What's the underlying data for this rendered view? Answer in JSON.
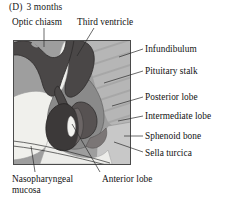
{
  "figure": {
    "panel_id": "(D)",
    "panel_title": "3 months",
    "type": "anatomical-diagram"
  },
  "labels": [
    {
      "key": "optic_chiasm",
      "text": "Optic chiasm",
      "position": "top-left"
    },
    {
      "key": "third_ventricle",
      "text": "Third ventricle",
      "position": "top-center"
    },
    {
      "key": "infundibulum",
      "text": "Infundibulum",
      "position": "right"
    },
    {
      "key": "pituitary_stalk",
      "text": "Pituitary stalk",
      "position": "right"
    },
    {
      "key": "posterior_lobe",
      "text": "Posterior lobe",
      "position": "right"
    },
    {
      "key": "intermediate_lobe",
      "text": "Intermediate lobe",
      "position": "right"
    },
    {
      "key": "sphenoid_bone",
      "text": "Sphenoid bone",
      "position": "right"
    },
    {
      "key": "sella_turcica",
      "text": "Sella turcica",
      "position": "right"
    },
    {
      "key": "anterior_lobe",
      "text": "Anterior lobe",
      "position": "bottom-center"
    },
    {
      "key": "nasopharyngeal_mucosa",
      "text": "Nasopharyngeal mucosa",
      "position": "bottom-left"
    }
  ],
  "colors": {
    "background": "#ffffff",
    "frame_border": "#4a4a4a",
    "brain_tissue": "#9a9a9a",
    "neural_dark": "#4d4a4a",
    "posterior_lobe": "#5a5555",
    "anterior_lobe": "#3f3c3c",
    "sphenoid_bone": "#b4b4b4",
    "cartilage_light": "#c9c9c9",
    "lumen_white": "#f2f2ef",
    "leader_line": "#3a3a3a",
    "text": "#111111"
  },
  "frame": {
    "x": 13,
    "y": 40,
    "width": 118,
    "height": 125
  }
}
